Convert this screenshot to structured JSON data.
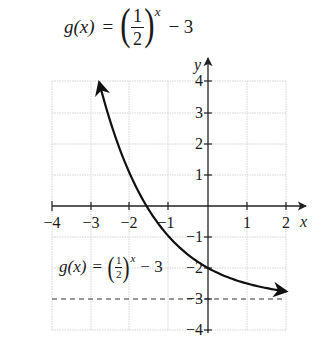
{
  "title": {
    "func_name": "g(x)",
    "equals": "=",
    "paren_open": "(",
    "numerator": "1",
    "denominator": "2",
    "paren_close": ")",
    "exponent": "x",
    "tail": "− 3"
  },
  "graph_label": {
    "func_name": "g(x)",
    "equals": "=",
    "paren_open": "(",
    "numerator": "1",
    "denominator": "2",
    "paren_close": ")",
    "exponent": "x",
    "tail": "− 3"
  },
  "axes": {
    "x_label": "x",
    "y_label": "y",
    "x_ticks": [
      "−4",
      "−3",
      "−2",
      "−1",
      "1",
      "2"
    ],
    "y_ticks": [
      "4",
      "3",
      "2",
      "1",
      "−1",
      "−2",
      "−3",
      "−4"
    ]
  },
  "colors": {
    "curve": "#111111",
    "grid": "#cfcfcf",
    "axis": "#222222",
    "asymptote": "#333333"
  },
  "chart_data": {
    "type": "line",
    "xlabel": "x",
    "ylabel": "y",
    "xlim": [
      -4,
      2
    ],
    "ylim": [
      -4,
      4
    ],
    "grid": true,
    "x_ticks": [
      -4,
      -3,
      -2,
      -1,
      1,
      2
    ],
    "y_ticks": [
      -4,
      -3,
      -2,
      -1,
      1,
      2,
      3,
      4
    ],
    "series": [
      {
        "name": "g(x) = (1/2)^x − 3",
        "function": "(1/2)^x - 3",
        "x": [
          -2.8,
          -2.5,
          -2,
          -1.585,
          -1,
          -0.5,
          0,
          0.5,
          1,
          1.5,
          2
        ],
        "values": [
          3.96,
          2.66,
          1,
          0,
          -1,
          -1.59,
          -2,
          -2.29,
          -2.5,
          -2.65,
          -2.75
        ],
        "arrows": "both ends"
      }
    ],
    "annotations": [
      {
        "type": "horizontal-asymptote",
        "y": -3,
        "style": "dashed"
      },
      {
        "type": "label",
        "text": "g(x) = (1/2)^x − 3",
        "x": -2.9,
        "y": -1.8
      },
      {
        "type": "y-intercept",
        "x": 0,
        "y": -2
      },
      {
        "type": "x-intercept",
        "x": -1.585,
        "y": 0
      }
    ]
  }
}
